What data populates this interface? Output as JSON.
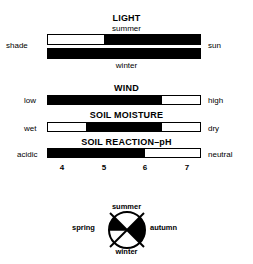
{
  "light": {
    "title": "LIGHT",
    "top_label": "summer",
    "bottom_label": "winter",
    "left_label": "shade",
    "right_label": "sun",
    "summer_fill": {
      "start": 0.37,
      "end": 1.0
    },
    "winter_fill": {
      "start": 0.0,
      "end": 1.0
    }
  },
  "wind": {
    "title": "WIND",
    "left_label": "low",
    "right_label": "high",
    "fill": {
      "start": 0.0,
      "end": 0.75
    }
  },
  "soil_moisture": {
    "title": "SOIL MOISTURE",
    "left_label": "wet",
    "right_label": "dry",
    "fill": {
      "start": 0.25,
      "end": 0.75
    }
  },
  "soil_ph": {
    "title": "SOIL REACTION–pH",
    "left_label": "acidic",
    "right_label": "neutral",
    "fill": {
      "start": 0.0,
      "end": 0.64
    },
    "ticks": [
      "4",
      "5",
      "6",
      "7"
    ]
  },
  "seasons": {
    "top": "summer",
    "bottom": "winter",
    "left": "spring",
    "right": "autumn"
  }
}
